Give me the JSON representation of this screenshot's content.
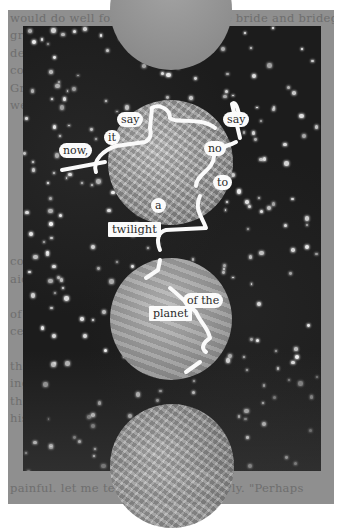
{
  "artwork": {
    "type": "altered book page / blackout poetry",
    "colors": {
      "page": "#8f8f8f",
      "sky": "#1c1c1c",
      "stars": "#f2f2f2",
      "word_highlight": "#fbfbfb",
      "ink": "#2a2a2a"
    }
  },
  "page_text": {
    "top_line": "would do well for himself he left the bride and bridegroom",
    "lines": [
      "gr            only waited            , to",
      "de                own sentiments     cal",
      "co              of unlearned        es.",
      "Gr               and Mrs            ler",
      "we                                   d",
      "                                      ",
      "                                      ",
      "                                      ",
      "                                      ",
      "                                      ",
      "                                      ",
      "                                      ",
      "                                      ",
      "                     conversation      ",
      "               aid of his first kno    ",
      "                                       ",
      "               of the da               ",
      "                    ceiling info       ",
      "                                       ",
      "               the whole course of h   ",
      "               ing without exaggera    ",
      "                   though the          ",
      "                     his e             "
    ],
    "bottom_line": "painful. let me tell you,   he said slowly. \"Perhaps"
  },
  "poem": {
    "words": [
      "say",
      "it",
      "now,",
      "say",
      "no",
      "to",
      "a",
      "twilight",
      "of the",
      "planet"
    ],
    "reading": "say it now, say no to a twilight of the planet"
  }
}
